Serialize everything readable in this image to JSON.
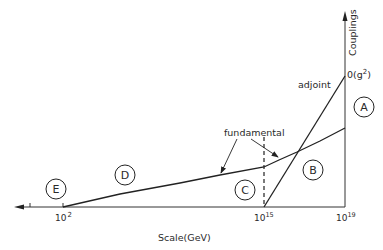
{
  "diagram": {
    "x_axis": {
      "label": "Scale(GeV)",
      "ticks": [
        {
          "label_base": "10",
          "label_exp": "2"
        },
        {
          "label_base": "10",
          "label_exp": "15"
        },
        {
          "label_base": "10",
          "label_exp": "19"
        }
      ]
    },
    "y_axis": {
      "label": "Couplings",
      "value_label_base": "0(g",
      "value_label_exp": "2",
      "value_label_end": ")"
    },
    "curves": {
      "adjoint_label": "adjoint",
      "fundamental_label": "fundamental"
    },
    "regions": [
      {
        "id": "A"
      },
      {
        "id": "B"
      },
      {
        "id": "C"
      },
      {
        "id": "D"
      },
      {
        "id": "E"
      }
    ]
  }
}
